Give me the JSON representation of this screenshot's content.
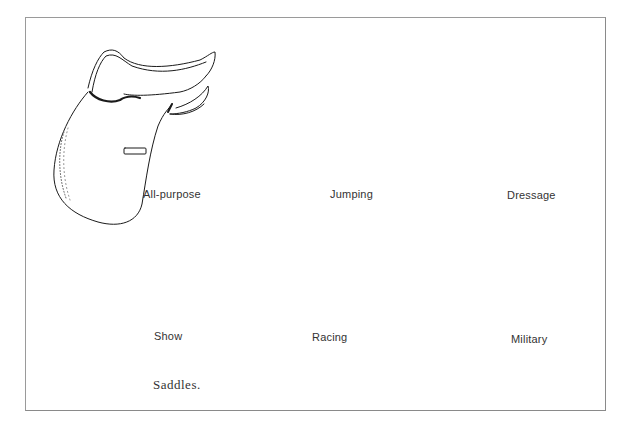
{
  "figure": {
    "caption": "Saddles.",
    "saddles": [
      {
        "label": "All-purpose"
      },
      {
        "label": "Jumping"
      },
      {
        "label": "Dressage"
      },
      {
        "label": "Show"
      },
      {
        "label": "Racing"
      },
      {
        "label": "Military"
      }
    ]
  },
  "colors": {
    "ink": "#1a1a1a",
    "frame": "#9a9a9a",
    "background": "#ffffff"
  }
}
